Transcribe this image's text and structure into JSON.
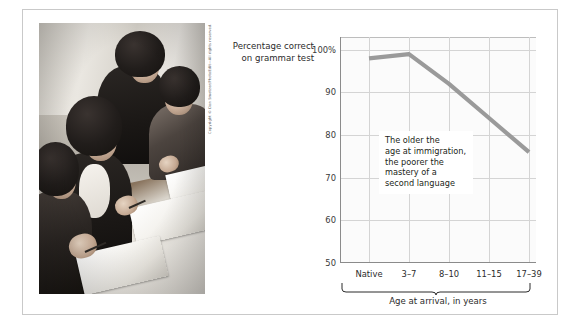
{
  "figure": {
    "photo": {
      "alt_description": "black-and-white photograph of adult immigrant women seated at long tables writing in workbooks during a language class",
      "credit": "Copyright © Don Smetzer/PhotoEdit—All rights reserved."
    }
  },
  "chart_data": {
    "type": "line",
    "title": "",
    "ylabel": "Percentage correct on grammar test",
    "xlabel": "Age at arrival, in years",
    "categories": [
      "Native",
      "3–7",
      "8–10",
      "11–15",
      "17–39"
    ],
    "values": [
      98,
      99,
      92,
      84,
      76
    ],
    "ytick_labels": [
      "100%",
      "90",
      "80",
      "70",
      "60",
      "50"
    ],
    "ytick_values": [
      100,
      90,
      80,
      70,
      60,
      50
    ],
    "ylim": [
      50,
      103
    ],
    "grid": "both",
    "legend": "none",
    "series_color": "#9a9a9a",
    "annotations": [
      {
        "name": "callout",
        "text": "The older the\nage at immigration,\nthe poorer the\nmastery of a\nsecond language"
      }
    ],
    "bracket_label": "Age at arrival, in years",
    "bracket_spans": [
      "3–7",
      "8–10",
      "11–15",
      "17–39"
    ]
  }
}
